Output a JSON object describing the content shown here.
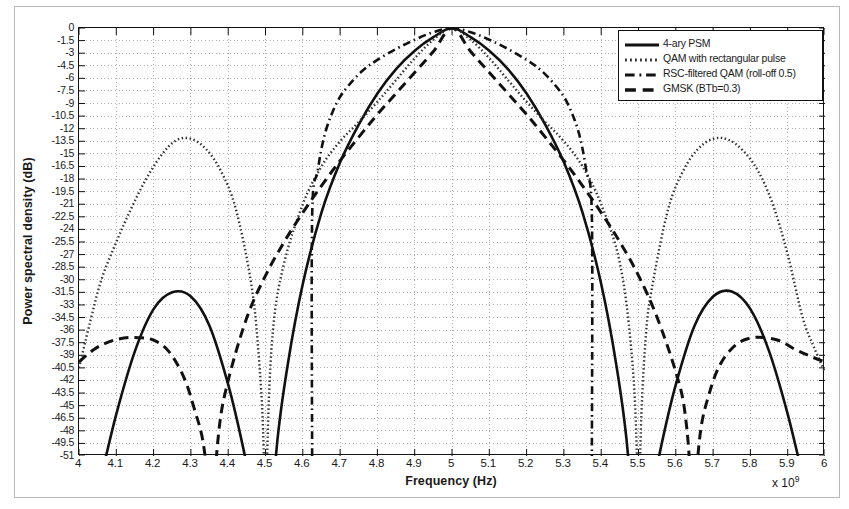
{
  "chart_data": {
    "type": "line",
    "title": "",
    "xlabel": "Frequency (Hz)",
    "ylabel": "Power spectral density (dB)",
    "x_multiplier": "x 10",
    "x_multiplier_exp": "9",
    "xlim": [
      4.0,
      6.0
    ],
    "ylim": [
      -51,
      0
    ],
    "grid": true,
    "legend_position": "top-right",
    "xticks": [
      "4",
      "4.1",
      "4.2",
      "4.3",
      "4.4",
      "4.5",
      "4.6",
      "4.7",
      "4.8",
      "4.9",
      "5",
      "5.1",
      "5.2",
      "5.3",
      "5.4",
      "5.5",
      "5.6",
      "5.7",
      "5.8",
      "5.9",
      "6"
    ],
    "xtick_values": [
      4.0,
      4.1,
      4.2,
      4.3,
      4.4,
      4.5,
      4.6,
      4.7,
      4.8,
      4.9,
      5.0,
      5.1,
      5.2,
      5.3,
      5.4,
      5.5,
      5.6,
      5.7,
      5.8,
      5.9,
      6.0
    ],
    "yticks": [
      "0",
      "-1.5",
      "-3",
      "-4.5",
      "-6",
      "-7.5",
      "-9",
      "-10.5",
      "-12",
      "-13.5",
      "-15",
      "-16.5",
      "-18",
      "-19.5",
      "-21",
      "-22.5",
      "-24",
      "-25.5",
      "-27",
      "-28.5",
      "-30",
      "-31.5",
      "-33",
      "-34.5",
      "-36",
      "-37.5",
      "-39",
      "-40.5",
      "-42",
      "-43.5",
      "-45",
      "-46.5",
      "-48",
      "-49.5",
      "-51"
    ],
    "ytick_values": [
      0,
      -1.5,
      -3,
      -4.5,
      -6,
      -7.5,
      -9,
      -10.5,
      -12,
      -13.5,
      -15,
      -16.5,
      -18,
      -19.5,
      -21,
      -22.5,
      -24,
      -25.5,
      -27,
      -28.5,
      -30,
      -31.5,
      -33,
      -34.5,
      -36,
      -37.5,
      -39,
      -40.5,
      -42,
      -43.5,
      -45,
      -46.5,
      -48,
      -49.5,
      -51
    ],
    "center_frequency": 5.0,
    "series": [
      {
        "name": "4-ary PSM",
        "style": "solid",
        "color": "#111111",
        "width": 2.6,
        "main_lobe_nulls": [
          4.5,
          5.5
        ],
        "sidelobe_peaks": [
          {
            "x": 4.26,
            "y": -31.4
          },
          {
            "x": 5.74,
            "y": -31.4
          }
        ],
        "points_x": [
          4.0,
          4.05,
          4.1,
          4.15,
          4.2,
          4.25,
          4.3,
          4.35,
          4.4,
          4.44,
          4.47,
          4.49,
          4.5,
          4.51,
          4.53,
          4.56,
          4.6,
          4.65,
          4.7,
          4.75,
          4.8,
          4.85,
          4.9,
          4.95,
          5.0,
          5.05,
          5.1,
          5.15,
          5.2,
          5.25,
          5.3,
          5.35,
          5.4,
          5.44,
          5.47,
          5.49,
          5.5,
          5.51,
          5.53,
          5.56,
          5.6,
          5.65,
          5.7,
          5.75,
          5.8,
          5.85,
          5.9,
          5.95,
          6.0
        ],
        "points_y": [
          -62.0,
          -55.0,
          -46.0,
          -38.5,
          -33.5,
          -31.5,
          -32.0,
          -35.5,
          -42.5,
          -50.0,
          -57.0,
          -64.0,
          -75.0,
          -64.0,
          -50.0,
          -40.0,
          -30.5,
          -22.0,
          -16.0,
          -11.5,
          -7.8,
          -4.9,
          -2.7,
          -1.1,
          0.0,
          -1.1,
          -2.7,
          -4.9,
          -7.8,
          -11.5,
          -16.0,
          -22.0,
          -30.5,
          -40.0,
          -50.0,
          -64.0,
          -75.0,
          -64.0,
          -57.0,
          -50.0,
          -42.5,
          -35.5,
          -32.0,
          -31.4,
          -33.5,
          -38.5,
          -46.0,
          -55.0,
          -62.0
        ]
      },
      {
        "name": "QAM with rectangular pulse",
        "style": "dotted",
        "color": "#333333",
        "width": 2.4,
        "main_lobe_nulls": [
          4.5,
          5.5
        ],
        "sidelobe_peaks": [
          {
            "x": 4.27,
            "y": -13.2
          },
          {
            "x": 4.72,
            "y": -13.2
          },
          {
            "x": 5.28,
            "y": -13.2
          },
          {
            "x": 5.73,
            "y": -13.2
          }
        ],
        "points_x": [
          4.0,
          4.03,
          4.06,
          4.1,
          4.14,
          4.18,
          4.22,
          4.26,
          4.3,
          4.34,
          4.38,
          4.42,
          4.46,
          4.48,
          4.495,
          4.5,
          4.505,
          4.52,
          4.55,
          4.6,
          4.65,
          4.7,
          4.75,
          4.8,
          4.85,
          4.9,
          4.95,
          5.0,
          5.05,
          5.1,
          5.15,
          5.2,
          5.25,
          5.3,
          5.35,
          5.4,
          5.45,
          5.48,
          5.495,
          5.5,
          5.505,
          5.52,
          5.54,
          5.58,
          5.62,
          5.66,
          5.7,
          5.74,
          5.78,
          5.82,
          5.86,
          5.9,
          5.94,
          5.97,
          6.0
        ],
        "points_y": [
          -40.5,
          -35.0,
          -30.0,
          -25.5,
          -21.5,
          -18.0,
          -15.2,
          -13.4,
          -13.2,
          -14.4,
          -17.0,
          -21.5,
          -30.0,
          -38.0,
          -50.0,
          -70.0,
          -50.0,
          -36.0,
          -28.0,
          -21.0,
          -16.5,
          -13.5,
          -11.2,
          -8.8,
          -6.2,
          -3.6,
          -1.4,
          0.0,
          -1.4,
          -3.6,
          -6.2,
          -8.8,
          -11.2,
          -13.5,
          -16.5,
          -21.0,
          -28.0,
          -38.0,
          -50.0,
          -70.0,
          -50.0,
          -36.5,
          -30.0,
          -21.5,
          -17.0,
          -14.4,
          -13.2,
          -13.3,
          -14.6,
          -17.0,
          -21.0,
          -27.0,
          -34.5,
          -38.0,
          -41.0
        ]
      },
      {
        "name": "RSC-filtered QAM  (roll-off 0.5)",
        "style": "dashdot",
        "color": "#111111",
        "width": 2.6,
        "cutoff_low": 4.625,
        "cutoff_high": 5.375,
        "points_x": [
          4.625,
          4.625,
          4.64,
          4.66,
          4.69,
          4.72,
          4.76,
          4.8,
          4.85,
          4.9,
          4.95,
          5.0,
          5.05,
          5.1,
          5.15,
          5.2,
          5.24,
          5.28,
          5.31,
          5.34,
          5.36,
          5.375,
          5.375
        ],
        "points_y": [
          -51.0,
          -22.5,
          -17.0,
          -12.5,
          -9.0,
          -7.0,
          -5.1,
          -3.8,
          -2.5,
          -1.4,
          -0.5,
          0.0,
          -0.5,
          -1.4,
          -2.5,
          -3.8,
          -5.1,
          -7.0,
          -9.0,
          -12.5,
          -17.0,
          -22.5,
          -51.0
        ]
      },
      {
        "name": "GMSK  (BTb=0.3)",
        "style": "dashed",
        "color": "#111111",
        "width": 3.0,
        "main_lobe_nulls": [
          4.355,
          5.645
        ],
        "sidelobe_peaks": [
          {
            "x": 4.145,
            "y": -36.9
          },
          {
            "x": 5.855,
            "y": -36.9
          }
        ],
        "points_x": [
          4.0,
          4.04,
          4.08,
          4.12,
          4.16,
          4.2,
          4.24,
          4.28,
          4.31,
          4.335,
          4.35,
          4.355,
          4.36,
          4.375,
          4.4,
          4.45,
          4.5,
          4.55,
          4.6,
          4.65,
          4.7,
          4.75,
          4.8,
          4.85,
          4.9,
          4.95,
          5.0,
          5.05,
          5.1,
          5.15,
          5.2,
          5.25,
          5.3,
          5.35,
          5.4,
          5.45,
          5.5,
          5.55,
          5.6,
          5.625,
          5.64,
          5.645,
          5.65,
          5.665,
          5.69,
          5.72,
          5.76,
          5.8,
          5.84,
          5.88,
          5.92,
          5.96,
          6.0
        ],
        "points_y": [
          -39.8,
          -38.3,
          -37.4,
          -36.95,
          -36.9,
          -37.2,
          -38.5,
          -41.5,
          -45.5,
          -50.0,
          -58.0,
          -72.0,
          -58.0,
          -48.0,
          -42.0,
          -34.5,
          -29.5,
          -25.5,
          -22.0,
          -18.8,
          -15.8,
          -13.0,
          -10.3,
          -7.8,
          -5.3,
          -2.8,
          0.0,
          -2.8,
          -5.3,
          -7.8,
          -10.3,
          -13.0,
          -15.8,
          -18.8,
          -22.0,
          -25.5,
          -29.5,
          -34.5,
          -41.0,
          -46.0,
          -55.0,
          -72.0,
          -58.0,
          -48.5,
          -43.5,
          -40.0,
          -37.8,
          -36.95,
          -36.9,
          -37.3,
          -38.3,
          -39.1,
          -39.8
        ]
      }
    ]
  },
  "legend": {
    "items": [
      {
        "label": "4-ary PSM",
        "style": "solid"
      },
      {
        "label": "QAM with rectangular pulse",
        "style": "dotted"
      },
      {
        "label": "RSC-filtered QAM  (roll-off 0.5)",
        "style": "dashdot"
      },
      {
        "label": "GMSK  (BTb=0.3)",
        "style": "dashed"
      }
    ]
  }
}
